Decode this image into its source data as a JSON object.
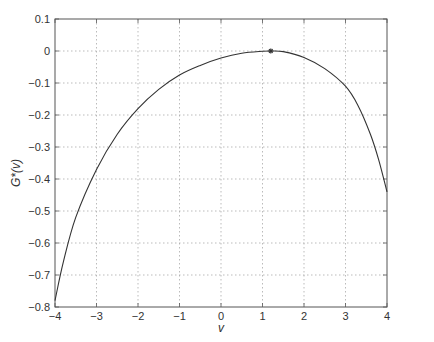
{
  "chart_data": {
    "type": "line",
    "title": "",
    "xlabel": "v",
    "ylabel": "G*(v)",
    "xlim": [
      -4,
      4
    ],
    "ylim": [
      -0.8,
      0.1
    ],
    "grid": true,
    "legend": null,
    "xticks": [
      -4,
      -3,
      -2,
      -1,
      0,
      1,
      2,
      3,
      4
    ],
    "xtick_labels": [
      "−4",
      "−3",
      "−2",
      "−1",
      "0",
      "1",
      "2",
      "3",
      "4"
    ],
    "yticks": [
      -0.8,
      -0.7,
      -0.6,
      -0.5,
      -0.4,
      -0.3,
      -0.2,
      -0.1,
      0,
      0.1
    ],
    "ytick_labels": [
      "−0.8",
      "−0.7",
      "−0.6",
      "−0.5",
      "−0.4",
      "−0.3",
      "−0.2",
      "−0.1",
      "0",
      "0.1"
    ],
    "series": [
      {
        "name": "G*(v)",
        "color": "#333333",
        "x": [
          -4.0,
          -3.8,
          -3.5,
          -3.0,
          -2.5,
          -2.0,
          -1.5,
          -1.0,
          -0.5,
          0.0,
          0.5,
          1.0,
          1.2,
          1.5,
          2.0,
          2.5,
          3.0,
          3.3,
          3.6,
          3.8,
          4.0
        ],
        "values": [
          -0.78,
          -0.66,
          -0.52,
          -0.37,
          -0.26,
          -0.18,
          -0.12,
          -0.075,
          -0.045,
          -0.022,
          -0.007,
          -0.001,
          0.0,
          -0.002,
          -0.02,
          -0.055,
          -0.11,
          -0.17,
          -0.26,
          -0.34,
          -0.44
        ]
      }
    ],
    "annotations": [
      {
        "type": "marker",
        "shape": "asterisk",
        "x": 1.2,
        "y": 0.0,
        "color": "#333333"
      }
    ]
  }
}
